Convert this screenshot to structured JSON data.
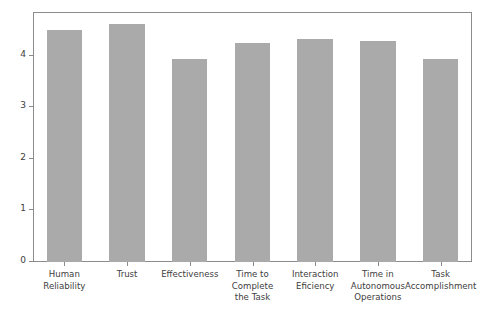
{
  "chart_data": {
    "type": "bar",
    "title": "",
    "subtitle": "",
    "xlabel": "",
    "ylabel": "",
    "categories": [
      "Human\nReliability",
      "Trust",
      "Effectiveness",
      "Time to\nComplete\nthe Task",
      "Interaction\nEficiency",
      "Time in\nAutonomous\nOperations",
      "Task\nAccomplishment"
    ],
    "values": [
      4.51,
      4.62,
      3.94,
      4.25,
      4.33,
      4.29,
      3.93
    ],
    "ylim": [
      0,
      4.85
    ],
    "yticks": [
      0,
      1,
      2,
      3,
      4
    ],
    "ytick_labels": [
      "0",
      "1",
      "2",
      "3",
      "4"
    ],
    "grid": false,
    "legend": null,
    "bar_color": "#aaaaaa",
    "frame_color": "#8c8c8c",
    "background": "#ffffff"
  }
}
